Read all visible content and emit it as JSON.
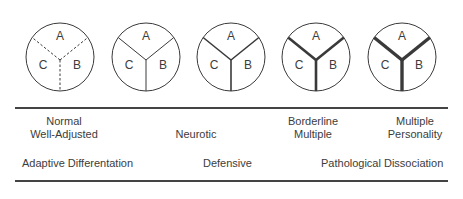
{
  "diagram": {
    "circles": [
      {
        "cx": 60,
        "cy": 57,
        "r": 34,
        "stroke_width": 1.0,
        "dashed": true,
        "labels": {
          "a": "A",
          "b": "B",
          "c": "C"
        }
      },
      {
        "cx": 146,
        "cy": 57,
        "r": 34,
        "stroke_width": 1.0,
        "dashed": false,
        "labels": {
          "a": "A",
          "b": "B",
          "c": "C"
        }
      },
      {
        "cx": 231,
        "cy": 57,
        "r": 34,
        "stroke_width": 1.6,
        "dashed": false,
        "labels": {
          "a": "A",
          "b": "B",
          "c": "C"
        }
      },
      {
        "cx": 316,
        "cy": 57,
        "r": 34,
        "stroke_width": 2.6,
        "dashed": false,
        "labels": {
          "a": "A",
          "b": "B",
          "c": "C"
        }
      },
      {
        "cx": 402,
        "cy": 57,
        "r": 34,
        "stroke_width": 3.4,
        "dashed": false,
        "labels": {
          "a": "A",
          "b": "B",
          "c": "C"
        }
      }
    ],
    "categories": [
      {
        "line1": "Normal",
        "line2": "Well-Adjusted",
        "x": 64
      },
      {
        "line1": "",
        "line2": "Neurotic",
        "x": 196
      },
      {
        "line1": "Borderline",
        "line2": "Multiple",
        "x": 313
      },
      {
        "line1": "Multiple",
        "line2": "Personality",
        "x": 415
      }
    ],
    "continuum": {
      "left": "Adaptive Differentation",
      "middle": "Defensive",
      "right": "Pathological Dissociation"
    },
    "colors": {
      "stroke": "#3a3a3a",
      "text": "#3c3c3c"
    }
  }
}
